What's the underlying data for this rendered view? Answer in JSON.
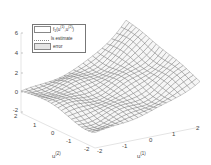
{
  "chart_data": {
    "type": "surface3d",
    "title": "",
    "xlabel": "u(1)",
    "ylabel": "u(2)",
    "zlabel": "",
    "x_ticks": [
      "-2",
      "-1",
      "0",
      "1",
      "2"
    ],
    "y_ticks": [
      "-2",
      "-1",
      "0",
      "1",
      "2"
    ],
    "z_ticks": [
      "-2",
      "0",
      "2",
      "4",
      "6"
    ],
    "xlim": [
      -2,
      2
    ],
    "ylim": [
      -2,
      2
    ],
    "zlim": [
      -2,
      6
    ],
    "legend": [
      {
        "label": "f1(u(1),u(2))",
        "style": "wireframe mesh"
      },
      {
        "label": "ls estimate",
        "style": "dotted"
      },
      {
        "label": "error",
        "style": "shaded gray"
      }
    ],
    "legend_position": "upper left",
    "grid": false
  },
  "legend": {
    "items": [
      {
        "main": "f",
        "sub": "1",
        "rest": "(u",
        "sup1": "(1)",
        "mid": ",u",
        "sup2": "(2)",
        "end": ")"
      },
      {
        "label": "ls estimate"
      },
      {
        "label": "error"
      }
    ]
  },
  "axes": {
    "z_ticks": [
      "6",
      "4",
      "2",
      "0",
      "-2"
    ],
    "u2_ticks": [
      "2",
      "1",
      "0",
      "-1",
      "-2"
    ],
    "u1_ticks": [
      "-2",
      "-1",
      "0",
      "1",
      "2"
    ],
    "u1_label": "u",
    "u1_label_sup": "(1)",
    "u2_label": "u",
    "u2_label_sup": "(2)"
  }
}
